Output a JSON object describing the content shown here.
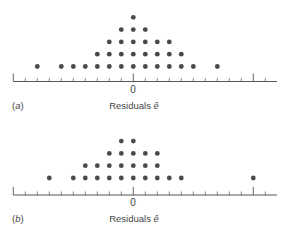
{
  "chart_data": [
    {
      "type": "scatter",
      "subtype": "dot-plot",
      "panel_label": "(a)",
      "xlabel": "Residuals ê",
      "tick_labels": [
        "0"
      ],
      "tick_range_units": [
        -10,
        11
      ],
      "major_ticks_units": [
        -10,
        0,
        10
      ],
      "columns_units": [
        -8,
        -6,
        -5,
        -4,
        -3,
        -2,
        -1,
        0,
        1,
        2,
        3,
        4,
        5,
        7
      ],
      "column_counts": [
        1,
        1,
        1,
        1,
        2,
        3,
        4,
        5,
        4,
        3,
        3,
        2,
        1,
        1
      ],
      "total_points": 32
    },
    {
      "type": "scatter",
      "subtype": "dot-plot",
      "panel_label": "(b)",
      "xlabel": "Residuals ê",
      "tick_labels": [
        "0"
      ],
      "tick_range_units": [
        -10,
        11
      ],
      "major_ticks_units": [
        -10,
        0,
        10
      ],
      "columns_units": [
        -7,
        -5,
        -4,
        -3,
        -2,
        -1,
        0,
        1,
        2,
        3,
        4,
        10
      ],
      "column_counts": [
        1,
        1,
        2,
        2,
        3,
        4,
        4,
        3,
        3,
        1,
        1,
        1
      ],
      "total_points": 25
    }
  ],
  "panels": {
    "a": {
      "label_prefix": "(",
      "label_letter": "a",
      "label_suffix": ")",
      "zero": "0",
      "xlabel_text": "Residuals ",
      "xlabel_symbol": "ê"
    },
    "b": {
      "label_prefix": "(",
      "label_letter": "b",
      "label_suffix": ")",
      "zero": "0",
      "xlabel_text": "Residuals ",
      "xlabel_symbol": "ê"
    }
  },
  "colors": {
    "dot": "#4a4a4a",
    "axis": "#555555"
  }
}
